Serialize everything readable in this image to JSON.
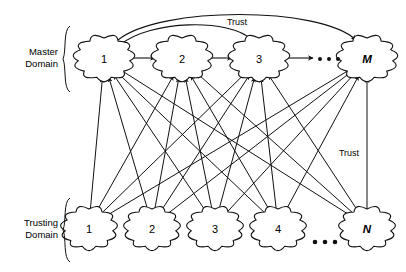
{
  "figure": {
    "width": 406,
    "height": 272,
    "background": "#ffffff",
    "ink_color": "#111111"
  },
  "groups": {
    "master": {
      "label_line1": "Master",
      "label_line2": "Domain",
      "brace_top": 26,
      "brace_bottom": 92,
      "brace_x": 70
    },
    "trusting": {
      "label_line1": "Trusting",
      "label_line2": "Domain",
      "brace_top": 198,
      "brace_bottom": 262,
      "brace_x": 70
    }
  },
  "master_nodes": [
    {
      "id": "m1",
      "label": "1",
      "x": 104,
      "y": 58,
      "rx": 26,
      "ry": 20,
      "italic": false
    },
    {
      "id": "m2",
      "label": "2",
      "x": 182,
      "y": 58,
      "rx": 26,
      "ry": 20,
      "italic": false
    },
    {
      "id": "m3",
      "label": "3",
      "x": 259,
      "y": 58,
      "rx": 26,
      "ry": 20,
      "italic": false
    },
    {
      "id": "mM",
      "label": "M",
      "x": 367,
      "y": 58,
      "rx": 26,
      "ry": 20,
      "italic": true
    }
  ],
  "trusting_nodes": [
    {
      "id": "t1",
      "label": "1",
      "x": 89,
      "y": 228,
      "rx": 24,
      "ry": 19,
      "italic": false
    },
    {
      "id": "t2",
      "label": "2",
      "x": 152,
      "y": 228,
      "rx": 24,
      "ry": 19,
      "italic": false
    },
    {
      "id": "t3",
      "label": "3",
      "x": 215,
      "y": 228,
      "rx": 24,
      "ry": 19,
      "italic": false
    },
    {
      "id": "t4",
      "label": "4",
      "x": 278,
      "y": 228,
      "rx": 24,
      "ry": 19,
      "italic": false
    },
    {
      "id": "tN",
      "label": "N",
      "x": 367,
      "y": 228,
      "rx": 24,
      "ry": 19,
      "italic": true
    }
  ],
  "peer_links": [
    {
      "from": "m1",
      "to": "m2",
      "x1": 132,
      "x2": 155,
      "y": 58,
      "bidirectional": true
    },
    {
      "from": "m2",
      "to": "m3",
      "x1": 209,
      "x2": 232,
      "y": 58,
      "bidirectional": true
    },
    {
      "from": "m3",
      "to": "dots",
      "x1": 286,
      "x2": 313,
      "y": 58,
      "bidirectional": true
    }
  ],
  "trust_arcs": [
    {
      "id": "arc-1-to-M",
      "label": "Trust",
      "from": "m1",
      "to": "mM",
      "path": "M 118 40 C 160 6, 320 6, 356 40",
      "arrow_start": true,
      "arrow_end": true
    },
    {
      "id": "arc-1-to-3",
      "label": "",
      "from": "m1",
      "to": "m3",
      "path": "M 120 45 C 150 20, 230 18, 252 40",
      "arrow_start": true,
      "arrow_end": true
    }
  ],
  "edge_labels": [
    {
      "id": "trust-top",
      "text": "Trust",
      "x": 237,
      "y": 25
    },
    {
      "id": "trust-right",
      "text": "Trust",
      "x": 349,
      "y": 156
    }
  ],
  "ellipses": [
    {
      "id": "master-ellipsis",
      "cx": 329,
      "cy": 59,
      "count": 3,
      "spacing": 9,
      "r": 2.0
    },
    {
      "id": "trusting-ellipsis",
      "cx": 325,
      "cy": 242,
      "count": 3,
      "spacing": 10,
      "r": 2.3
    }
  ],
  "mesh_links": {
    "description": "Each trusting domain sends a trust arrow up to each master domain",
    "arrow_direction": "trusting-to-master",
    "pairs": [
      {
        "from": "t1",
        "to": "m1"
      },
      {
        "from": "t1",
        "to": "m2"
      },
      {
        "from": "t1",
        "to": "m3"
      },
      {
        "from": "t1",
        "to": "mM"
      },
      {
        "from": "t2",
        "to": "m1"
      },
      {
        "from": "t2",
        "to": "m2"
      },
      {
        "from": "t2",
        "to": "m3"
      },
      {
        "from": "t2",
        "to": "mM"
      },
      {
        "from": "t3",
        "to": "m1"
      },
      {
        "from": "t3",
        "to": "m2"
      },
      {
        "from": "t3",
        "to": "m3"
      },
      {
        "from": "t3",
        "to": "mM"
      },
      {
        "from": "t4",
        "to": "m1"
      },
      {
        "from": "t4",
        "to": "m2"
      },
      {
        "from": "t4",
        "to": "m3"
      },
      {
        "from": "t4",
        "to": "mM"
      },
      {
        "from": "tN",
        "to": "m1"
      },
      {
        "from": "tN",
        "to": "m2"
      },
      {
        "from": "tN",
        "to": "m3"
      },
      {
        "from": "tN",
        "to": "mM"
      }
    ]
  }
}
